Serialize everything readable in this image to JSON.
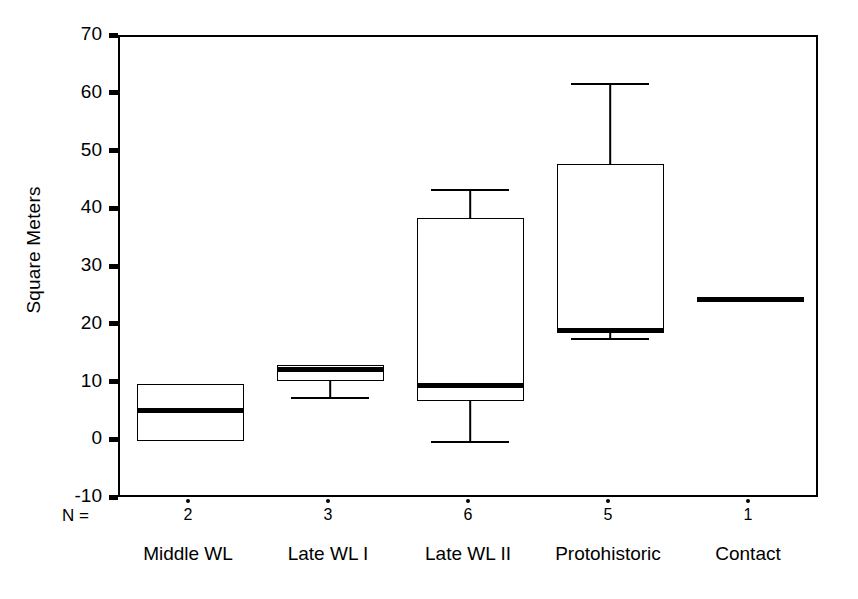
{
  "chart_data": {
    "type": "box",
    "title": "",
    "xlabel": "",
    "ylabel": "Square Meters",
    "ylim": [
      -10,
      70
    ],
    "ytick_labels": [
      "70",
      "60",
      "50",
      "40",
      "30",
      "20",
      "10",
      "0",
      "-10"
    ],
    "ytick_values": [
      70,
      60,
      50,
      40,
      30,
      20,
      10,
      0,
      -10
    ],
    "grid": false,
    "legend": "none",
    "n_row_label": "N =",
    "categories": [
      "Middle WL",
      "Late WL I",
      "Late WL II",
      "Protohistoric",
      "Contact"
    ],
    "counts": [
      "2",
      "3",
      "6",
      "5",
      "1"
    ],
    "boxes": [
      {
        "category": "Middle WL",
        "n": 2,
        "q1": 0.0,
        "median": 5.3,
        "q3": 10.0,
        "whisker_low": null,
        "whisker_high": null
      },
      {
        "category": "Late WL I",
        "n": 3,
        "q1": 10.5,
        "median": 12.5,
        "q3": 13.2,
        "whisker_low": 7.7,
        "whisker_high": null
      },
      {
        "category": "Late WL II",
        "n": 6,
        "q1": 7.0,
        "median": 9.6,
        "q3": 38.7,
        "whisker_low": 0.0,
        "whisker_high": 43.7
      },
      {
        "category": "Protohistoric",
        "n": 5,
        "q1": 19.2,
        "median": 19.2,
        "q3": 48.0,
        "whisker_low": 17.8,
        "whisker_high": 62.0
      },
      {
        "category": "Contact",
        "n": 1,
        "q1": 24.5,
        "median": 24.5,
        "q3": 24.5,
        "whisker_low": null,
        "whisker_high": null
      }
    ],
    "colors": {
      "axis": "#000000",
      "box_edge": "#000000",
      "median": "#000000",
      "background": "#ffffff"
    }
  }
}
